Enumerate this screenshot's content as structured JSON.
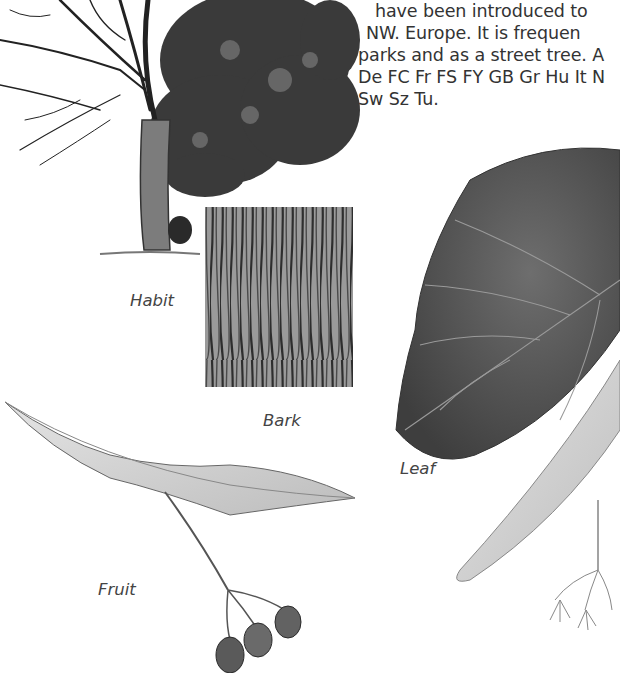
{
  "text_block": {
    "lines": [
      "have been introduced to",
      "NW. Europe. It is frequen",
      "parks and as a street tree. A",
      "De FC Fr FS FY GB Gr Hu It N",
      "Sw Sz Tu."
    ]
  },
  "captions": {
    "habit": "Habit",
    "bark": "Bark",
    "leaf": "Leaf",
    "fruit": "Fruit"
  },
  "illustrations": [
    {
      "name": "habit",
      "subject": "tree-habit"
    },
    {
      "name": "bark",
      "subject": "bark-texture"
    },
    {
      "name": "leaf",
      "subject": "leaf-with-bract-and-flowers"
    },
    {
      "name": "fruit",
      "subject": "fruit-with-bract"
    }
  ],
  "colors": {
    "paper": "#ffffff",
    "ink": "#2a2a2a",
    "leaf_dark": "#5a5a5a",
    "bract_light": "#d8d8d8"
  }
}
